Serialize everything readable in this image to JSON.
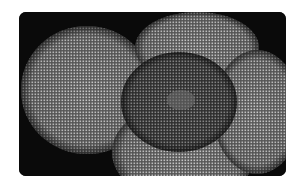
{
  "image": {
    "subject": "diatom-micrograph",
    "description": "Grayscale electron micrograph of overlapping circular diatom valves with radial areolae pattern",
    "colors": {
      "background": "#0a0a0a",
      "valve": "#8a8a8a",
      "center": "#4a4a4a"
    }
  }
}
